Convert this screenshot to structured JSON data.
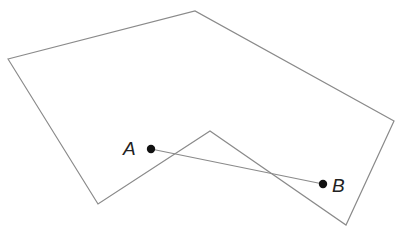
{
  "diagram": {
    "colors": {
      "background": "#ffffff",
      "polygon_stroke": "#8a8a8a",
      "segment_stroke": "#8a8a8a",
      "point_fill": "#111111",
      "label": "#222222"
    },
    "polygon": {
      "vertices": [
        [
          8,
          59
        ],
        [
          195,
          11
        ],
        [
          394,
          121
        ],
        [
          346,
          225
        ],
        [
          210,
          131
        ],
        [
          98,
          204
        ]
      ]
    },
    "points": [
      {
        "id": "A",
        "label": "A",
        "x": 151,
        "y": 149,
        "label_x": 123,
        "label_y": 155
      },
      {
        "id": "B",
        "label": "B",
        "x": 323,
        "y": 184,
        "label_x": 332,
        "label_y": 192
      }
    ],
    "segment": {
      "from": "A",
      "to": "B"
    }
  }
}
